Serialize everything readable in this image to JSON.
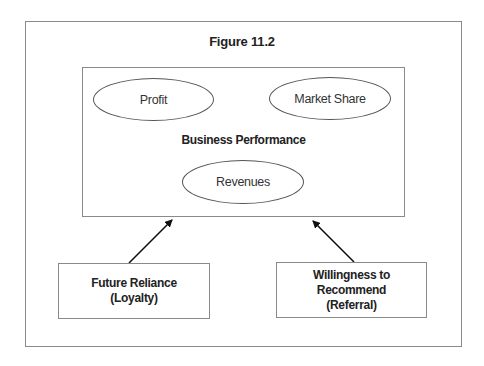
{
  "figure": {
    "title": "Figure 11.2",
    "center_box": {
      "label": "Business Performance",
      "ellipses": [
        {
          "label": "Profit"
        },
        {
          "label": "Market Share"
        },
        {
          "label": "Revenues"
        }
      ]
    },
    "drivers": [
      {
        "line1": "Future Reliance",
        "line2": "(Loyalty)"
      },
      {
        "line1": "Willingness to Recommend",
        "line2": "(Referral)"
      }
    ],
    "arrows": [
      {
        "from": "Future Reliance (Loyalty)",
        "to": "Business Performance"
      },
      {
        "from": "Willingness to Recommend (Referral)",
        "to": "Business Performance"
      }
    ]
  }
}
